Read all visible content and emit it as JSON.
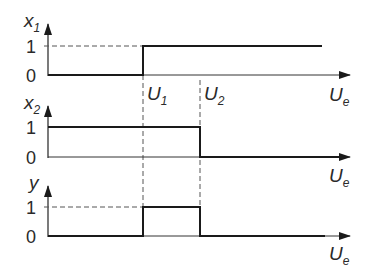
{
  "diagram": {
    "type": "step-function timing diagram",
    "x_axis_label": "U",
    "x_axis_label_sub": "e",
    "thresholds": [
      {
        "label": "U",
        "sub": "1"
      },
      {
        "label": "U",
        "sub": "2"
      }
    ],
    "plots": [
      {
        "id": "x1",
        "y_label": "x",
        "y_sub": "1",
        "tick_high": "1",
        "tick_low": "0",
        "description": "0 for Ue < U1, 1 for Ue >= U1"
      },
      {
        "id": "x2",
        "y_label": "x",
        "y_sub": "2",
        "tick_high": "1",
        "tick_low": "0",
        "description": "1 for Ue < U2, 0 for Ue >= U2"
      },
      {
        "id": "y",
        "y_label": "y",
        "y_sub": "",
        "tick_high": "1",
        "tick_low": "0",
        "description": "1 for U1 <= Ue < U2, else 0"
      }
    ]
  },
  "colors": {
    "line": "#1a1a1a",
    "axis": "#333333",
    "dash": "#555555",
    "background": "#ffffff"
  }
}
